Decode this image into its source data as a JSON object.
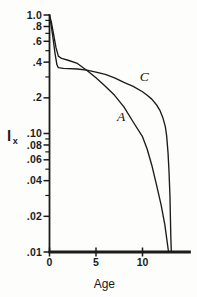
{
  "figure": {
    "background": "#fdfdfc",
    "ink": "#1b1b1b"
  },
  "chart_data": {
    "type": "line",
    "title": "",
    "xlabel": "Age",
    "ylabel": "lx",
    "ylabel_main": "l",
    "ylabel_sub": "x",
    "y_scale": "log",
    "grid": false,
    "legend": "inline-curve-labels",
    "x_axis": {
      "min": 0,
      "max": 15.2,
      "title": "Age",
      "ticks": [
        {
          "v": 0,
          "label": "0"
        },
        {
          "v": 5,
          "label": "5"
        },
        {
          "v": 10,
          "label": "10"
        }
      ]
    },
    "y_axis": {
      "min": 0.01,
      "max": 1.0,
      "scale": "log",
      "ticks": [
        {
          "v": 1.0,
          "label": "1.0"
        },
        {
          "v": 0.8,
          "label": ".8"
        },
        {
          "v": 0.6,
          "label": ".6"
        },
        {
          "v": 0.4,
          "label": ".4"
        },
        {
          "v": 0.2,
          "label": ".2"
        },
        {
          "v": 0.1,
          "label": ".10"
        },
        {
          "v": 0.08,
          "label": ".08"
        },
        {
          "v": 0.06,
          "label": ".06"
        },
        {
          "v": 0.04,
          "label": ".04"
        },
        {
          "v": 0.02,
          "label": ".02"
        },
        {
          "v": 0.01,
          "label": ".01"
        }
      ],
      "minor_ticks": [
        0.9,
        0.7,
        0.5,
        0.3,
        0.09,
        0.07,
        0.05,
        0.03
      ]
    },
    "series": [
      {
        "name": "A",
        "label": "A",
        "label_pos": {
          "age": 7.7,
          "lx": 0.14
        },
        "points": [
          [
            0,
            1.0
          ],
          [
            0.2,
            0.87
          ],
          [
            0.45,
            0.68
          ],
          [
            0.7,
            0.53
          ],
          [
            0.95,
            0.45
          ],
          [
            1.3,
            0.43
          ],
          [
            2,
            0.415
          ],
          [
            3,
            0.39
          ],
          [
            3.7,
            0.355
          ],
          [
            4,
            0.342
          ],
          [
            5,
            0.295
          ],
          [
            6,
            0.25
          ],
          [
            7,
            0.21
          ],
          [
            8,
            0.168
          ],
          [
            9,
            0.125
          ],
          [
            10,
            0.094
          ],
          [
            10.5,
            0.074
          ],
          [
            11,
            0.054
          ],
          [
            11.5,
            0.037
          ],
          [
            12,
            0.025
          ],
          [
            12.4,
            0.017
          ],
          [
            12.8,
            0.01
          ]
        ]
      },
      {
        "name": "C",
        "label": "C",
        "label_pos": {
          "age": 10.2,
          "lx": 0.3
        },
        "points": [
          [
            0,
            1.0
          ],
          [
            0.2,
            0.8
          ],
          [
            0.4,
            0.62
          ],
          [
            0.6,
            0.47
          ],
          [
            0.8,
            0.38
          ],
          [
            0.95,
            0.36
          ],
          [
            1.5,
            0.355
          ],
          [
            3,
            0.35
          ],
          [
            4,
            0.343
          ],
          [
            5,
            0.33
          ],
          [
            6,
            0.315
          ],
          [
            7,
            0.295
          ],
          [
            8,
            0.27
          ],
          [
            9,
            0.25
          ],
          [
            10,
            0.225
          ],
          [
            10.5,
            0.21
          ],
          [
            11,
            0.195
          ],
          [
            11.5,
            0.175
          ],
          [
            11.9,
            0.155
          ],
          [
            12.2,
            0.135
          ],
          [
            12.45,
            0.115
          ],
          [
            12.6,
            0.095
          ],
          [
            12.75,
            0.068
          ],
          [
            12.85,
            0.048
          ],
          [
            12.95,
            0.03
          ],
          [
            13.05,
            0.013
          ],
          [
            13.1,
            0.01
          ]
        ]
      }
    ]
  }
}
